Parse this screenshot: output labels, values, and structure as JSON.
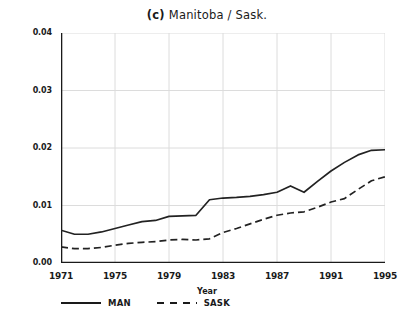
{
  "chart_data": {
    "type": "line",
    "title_panel": "(c)",
    "title_text": "Manitoba / Sask.",
    "xlabel": "Year",
    "ylabel": "FTE Enrolment Rate",
    "xlim": [
      1971,
      1995
    ],
    "ylim": [
      0.0,
      0.04
    ],
    "grid": true,
    "legend_position": "below-axes-left",
    "x": [
      1971,
      1972,
      1973,
      1974,
      1975,
      1976,
      1977,
      1978,
      1979,
      1980,
      1981,
      1982,
      1983,
      1984,
      1985,
      1986,
      1987,
      1988,
      1989,
      1990,
      1991,
      1992,
      1993,
      1994,
      1995
    ],
    "series": [
      {
        "name": "MAN",
        "style": "solid",
        "color": "#222222",
        "values": [
          0.0057,
          0.005,
          0.005,
          0.0054,
          0.006,
          0.0066,
          0.0072,
          0.0074,
          0.0081,
          0.0082,
          0.0083,
          0.011,
          0.0113,
          0.0114,
          0.0116,
          0.0119,
          0.0123,
          0.0134,
          0.0123,
          0.0142,
          0.016,
          0.0175,
          0.0188,
          0.0196,
          0.0197
        ]
      },
      {
        "name": "SASK",
        "style": "dashed",
        "color": "#222222",
        "values": [
          0.0028,
          0.0025,
          0.0025,
          0.0027,
          0.0031,
          0.0034,
          0.0036,
          0.0037,
          0.004,
          0.0041,
          0.004,
          0.0042,
          0.0053,
          0.006,
          0.0068,
          0.0076,
          0.0083,
          0.0087,
          0.0089,
          0.0097,
          0.0106,
          0.0112,
          0.0128,
          0.0143,
          0.015
        ]
      }
    ],
    "yticks": [
      {
        "value": 0.0,
        "label": "0.00"
      },
      {
        "value": 0.01,
        "label": "0.01"
      },
      {
        "value": 0.02,
        "label": "0.02"
      },
      {
        "value": 0.03,
        "label": "0.03"
      },
      {
        "value": 0.04,
        "label": "0.04"
      }
    ],
    "xticks": [
      {
        "value": 1971,
        "label": "1971"
      },
      {
        "value": 1975,
        "label": "1975"
      },
      {
        "value": 1979,
        "label": "1979"
      },
      {
        "value": 1983,
        "label": "1983"
      },
      {
        "value": 1987,
        "label": "1987"
      },
      {
        "value": 1991,
        "label": "1991"
      },
      {
        "value": 1995,
        "label": "1995"
      }
    ],
    "legend": [
      {
        "label": "MAN",
        "style": "solid"
      },
      {
        "label": "SASK",
        "style": "dashed"
      }
    ]
  }
}
